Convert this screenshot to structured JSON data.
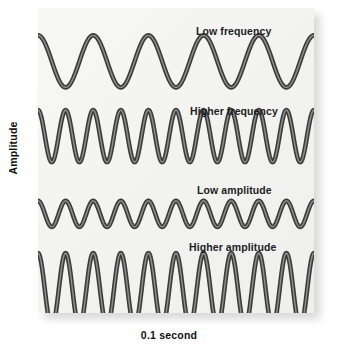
{
  "figure": {
    "title": "",
    "background_color": "#ffffff",
    "panel_color": "#f4f4f2",
    "wave_stroke_color": "#3a3a3a",
    "wave_core_color": "#8e8e8e"
  },
  "axes": {
    "y_label": "Amplitude",
    "x_label": "0.1 second"
  },
  "chart_data": {
    "type": "line",
    "title": "",
    "subtitle": "",
    "xlabel": "0.1 second",
    "ylabel": "Amplitude",
    "grid": false,
    "legend_position": "inline-above-each-trace",
    "xlim": [
      0,
      1
    ],
    "ylim": [
      -1,
      1
    ],
    "x_units": "0.1 second (full panel width)",
    "annotations": [
      "Low frequency",
      "Higher frequency",
      "Low amplitude",
      "Higher amplitude"
    ],
    "series": [
      {
        "name": "Low frequency",
        "label": "Low frequency",
        "waveform": "sine",
        "cycles": 5,
        "relative_amplitude": 0.55,
        "phase_deg": 90,
        "baseline_y_frac": 0.175,
        "amplitude_px": 26,
        "values": [
          1,
          0,
          -1,
          0,
          1,
          0,
          -1,
          0,
          1,
          0,
          -1,
          0,
          1,
          0,
          -1,
          0,
          1,
          0,
          -1,
          0,
          1
        ]
      },
      {
        "name": "Higher frequency",
        "label": "Higher frequency",
        "waveform": "sine",
        "cycles": 10,
        "relative_amplitude": 0.55,
        "phase_deg": 90,
        "baseline_y_frac": 0.42,
        "amplitude_px": 26,
        "values": [
          1,
          0,
          -1,
          0,
          1,
          0,
          -1,
          0,
          1,
          0,
          -1,
          0,
          1,
          0,
          -1,
          0,
          1,
          0,
          -1,
          0,
          1,
          0,
          -1,
          0,
          1,
          0,
          -1,
          0,
          1,
          0,
          -1,
          0,
          1,
          0,
          -1,
          0,
          1,
          0,
          -1,
          0,
          1
        ]
      },
      {
        "name": "Low amplitude",
        "label": "Low amplitude",
        "waveform": "sine",
        "cycles": 10,
        "relative_amplitude": 0.28,
        "phase_deg": 90,
        "baseline_y_frac": 0.675,
        "amplitude_px": 13,
        "values": [
          1,
          0,
          -1,
          0,
          1,
          0,
          -1,
          0,
          1,
          0,
          -1,
          0,
          1,
          0,
          -1,
          0,
          1,
          0,
          -1,
          0,
          1,
          0,
          -1,
          0,
          1,
          0,
          -1,
          0,
          1,
          0,
          -1,
          0,
          1,
          0,
          -1,
          0,
          1,
          0,
          -1,
          0,
          1
        ]
      },
      {
        "name": "Higher amplitude",
        "label": "Higher amplitude",
        "waveform": "sine",
        "cycles": 10,
        "relative_amplitude": 0.95,
        "phase_deg": 90,
        "baseline_y_frac": 0.925,
        "amplitude_px": 37,
        "values": [
          1,
          0,
          -1,
          0,
          1,
          0,
          -1,
          0,
          1,
          0,
          -1,
          0,
          1,
          0,
          -1,
          0,
          1,
          0,
          -1,
          0,
          1,
          0,
          -1,
          0,
          1,
          0,
          -1,
          0,
          1,
          0,
          -1,
          0,
          1,
          0,
          -1,
          0,
          1,
          0,
          -1,
          0,
          1
        ]
      }
    ]
  },
  "labels": {
    "wave1": "Low frequency",
    "wave2": "Higher frequency",
    "wave3": "Low amplitude",
    "wave4": "Higher amplitude"
  }
}
